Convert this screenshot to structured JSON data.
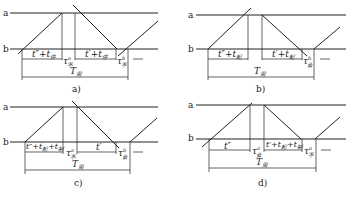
{
  "figure": {
    "line_labels": {
      "top": "a",
      "bottom": "b"
    },
    "panels": [
      {
        "id": "a",
        "caption": "a)",
        "segments": [
          {
            "main": "t″+t",
            "sub": "停"
          },
          {
            "main": "τ",
            "sup": "a",
            "sub": "不"
          },
          {
            "main": "t′+t",
            "sub": "停"
          },
          {
            "main": "τ",
            "sup": "b",
            "sub": "不"
          }
        ],
        "period": {
          "main": "T",
          "sub": "周"
        }
      },
      {
        "id": "b",
        "caption": "b)",
        "segments": [
          {
            "main": "t″+t",
            "sub": "起"
          },
          {
            "main": "t′+t",
            "sub": "起"
          },
          {
            "main": "τ",
            "sup": "b",
            "sub": "会"
          }
        ],
        "period": {
          "main": "T",
          "sub": "周"
        }
      },
      {
        "id": "c",
        "caption": "c)",
        "segments": [
          {
            "main": "t″+t",
            "sub": "起",
            "main2": "+t",
            "sub2": "制"
          },
          {
            "main": "τ",
            "sup": "a",
            "sub": "不"
          },
          {
            "main": "t′"
          },
          {
            "main": "τ",
            "sup": "b",
            "sub": "会"
          }
        ],
        "period": {
          "main": "T",
          "sub": "周"
        }
      },
      {
        "id": "d",
        "caption": "d)",
        "segments": [
          {
            "main": "t″"
          },
          {
            "main": "τ",
            "sup": "a",
            "sub": "会"
          },
          {
            "main": "t′+t",
            "sub": "起",
            "main2": "+t",
            "sub2": "制"
          },
          {
            "main": "τ",
            "sup": "a",
            "sub": "不"
          }
        ],
        "period": {
          "main": "T",
          "sub": "周"
        }
      }
    ]
  }
}
